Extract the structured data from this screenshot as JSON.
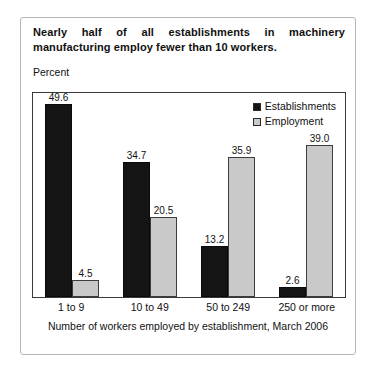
{
  "card": {
    "title_line1": "Nearly half of all establishments in machinery",
    "title_line2": "manufacturing employ fewer than 10 workers.",
    "axis_label": "Percent",
    "footer": "Number of workers employed by establishment, March 2006"
  },
  "legend": {
    "series1_label": "Establishments",
    "series2_label": "Employment",
    "series1_color": "#141414",
    "series2_color": "#c9c9c9"
  },
  "chart_data": {
    "type": "bar",
    "title": "Nearly half of all establishments in machinery manufacturing employ fewer than 10 workers.",
    "xlabel": "Number of workers employed by establishment, March 2006",
    "ylabel": "Percent",
    "categories": [
      "1 to 9",
      "10 to 49",
      "50 to 249",
      "250 or more"
    ],
    "series": [
      {
        "name": "Establishments",
        "color": "#141414",
        "values": [
          49.6,
          34.7,
          13.2,
          2.6
        ]
      },
      {
        "name": "Employment",
        "color": "#c9c9c9",
        "values": [
          4.5,
          20.5,
          35.9,
          39.0
        ]
      }
    ],
    "ylim": [
      0,
      53
    ],
    "grid": false,
    "legend_position": "top-right",
    "value_labels": true,
    "value_label_format": "one-decimal"
  }
}
